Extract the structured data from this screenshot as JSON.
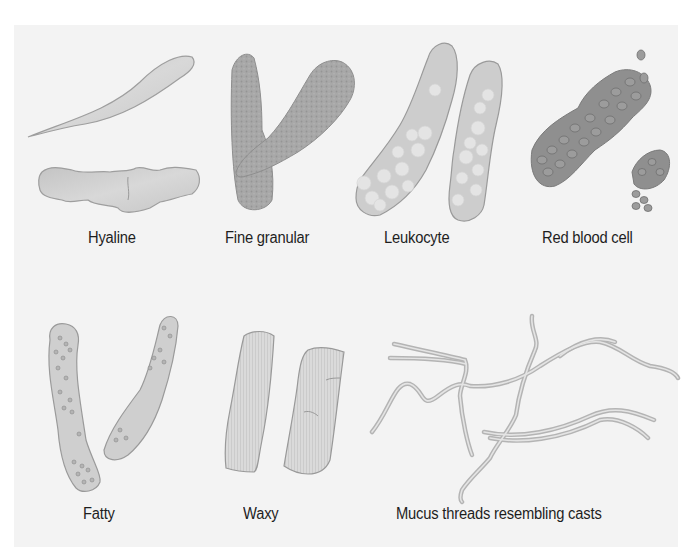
{
  "figure": {
    "background_color": "#f3f3f3",
    "colors": {
      "cast_fill": "#c9c9c9",
      "cast_outline": "#9a9a9a",
      "granular_fill": "#a6a6a6",
      "rbc_fill": "#8c8c8c",
      "leukocyte_fill": "#e9e9e9",
      "text": "#1e1e1e"
    },
    "panels": [
      {
        "id": "hyaline",
        "label": "Hyaline"
      },
      {
        "id": "fine-granular",
        "label": "Fine granular"
      },
      {
        "id": "leukocyte",
        "label": "Leukocyte"
      },
      {
        "id": "red-blood-cell",
        "label": "Red blood cell"
      },
      {
        "id": "fatty",
        "label": "Fatty"
      },
      {
        "id": "waxy",
        "label": "Waxy"
      },
      {
        "id": "mucus-threads",
        "label": "Mucus threads resembling casts"
      }
    ]
  }
}
